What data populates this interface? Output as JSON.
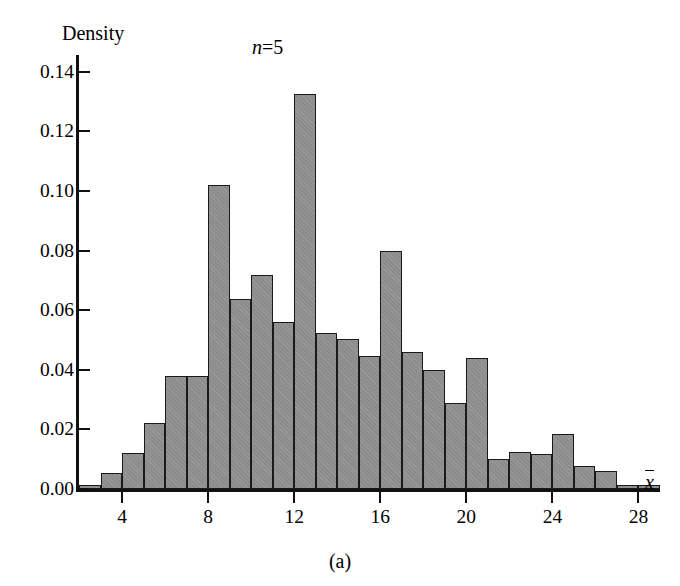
{
  "figure": {
    "panel_label": "(a)",
    "annotation": "n = 5",
    "annotation_symbol": "n",
    "annotation_eq": "=",
    "annotation_value": "5"
  },
  "axes": {
    "y_title": "Density",
    "x_title": "x",
    "x_title_is_mean": true,
    "y_ticks": [
      "0.00",
      "0.02",
      "0.04",
      "0.06",
      "0.08",
      "0.10",
      "0.12",
      "0.14"
    ],
    "y_tick_values": [
      0.0,
      0.02,
      0.04,
      0.06,
      0.08,
      0.1,
      0.12,
      0.14
    ],
    "x_ticks": [
      "4",
      "8",
      "12",
      "16",
      "20",
      "24",
      "28"
    ],
    "x_tick_values": [
      4,
      8,
      12,
      16,
      20,
      24,
      28
    ]
  },
  "chart_data": {
    "type": "bar",
    "title": "",
    "subtitle": "n = 5",
    "xlabel": "x̄",
    "ylabel": "Density",
    "xlim": [
      2,
      29
    ],
    "ylim": [
      0.0,
      0.145
    ],
    "grid": false,
    "legend": null,
    "bin_width": 1,
    "bin_edges": [
      2,
      3,
      4,
      5,
      6,
      7,
      8,
      9,
      10,
      11,
      12,
      13,
      14,
      15,
      16,
      17,
      18,
      19,
      20,
      21,
      22,
      23,
      24,
      25,
      26,
      27,
      28,
      29
    ],
    "categories": [
      "2-3",
      "3-4",
      "4-5",
      "5-6",
      "6-7",
      "7-8",
      "8-9",
      "9-10",
      "10-11",
      "11-12",
      "12-13",
      "13-14",
      "14-15",
      "15-16",
      "16-17",
      "17-18",
      "18-19",
      "19-20",
      "20-21",
      "21-22",
      "22-23",
      "23-24",
      "24-25",
      "25-26",
      "26-27",
      "27-28",
      "28-29"
    ],
    "values": [
      0.0015,
      0.0055,
      0.012,
      0.0222,
      0.038,
      0.038,
      0.102,
      0.0638,
      0.072,
      0.056,
      0.1325,
      0.0525,
      0.0505,
      0.0445,
      0.08,
      0.046,
      0.04,
      0.0288,
      0.044,
      0.0102,
      0.0125,
      0.0118,
      0.0185,
      0.0078,
      0.006,
      0.0015,
      0.0015
    ]
  }
}
